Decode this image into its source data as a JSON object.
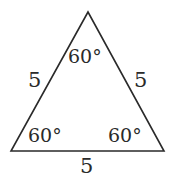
{
  "diagram": {
    "shape": "equilateral triangle",
    "side_labels": {
      "left": "5",
      "right": "5",
      "bottom": "5"
    },
    "angle_labels": {
      "top": "60°",
      "bottom_left": "60°",
      "bottom_right": "60°"
    },
    "colors": {
      "stroke": "#2a2a2a",
      "background": "#ffffff"
    }
  }
}
